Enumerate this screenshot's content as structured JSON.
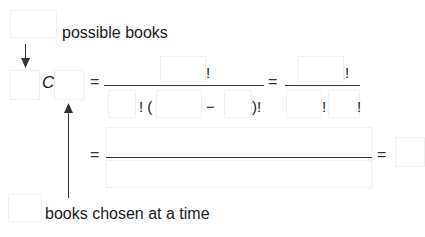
{
  "labels": {
    "top": "possible books",
    "bottom": "books chosen at a time"
  },
  "formula": {
    "combination_symbol": "C",
    "equals": "=",
    "factorial": "!",
    "open_paren_factorial": "! (",
    "minus": "−",
    "close_paren_factorial": ")!"
  },
  "colors": {
    "text": "#1a1a1a",
    "line": "#333333",
    "blank_box_border": "#f0f0f0"
  }
}
